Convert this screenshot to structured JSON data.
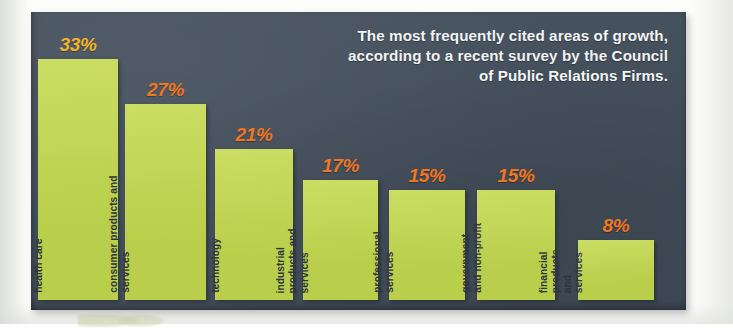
{
  "chart_title": "The most frequently cited areas of growth, according to a recent survey by the Council of Public Relations Firms.",
  "colors": {
    "panel_background": "#44505d",
    "bar_fill": "#c3d94e",
    "value_orange": "#ef7722",
    "value_gold": "#f0b429",
    "label_text": "#2d3540",
    "title_text": "#f2f4f4",
    "page_background": "#fdfdfb"
  },
  "chart_data": {
    "type": "bar",
    "title": "The most frequently cited areas of growth, according to a recent survey by the Council of Public Relations Firms.",
    "xlabel": "",
    "ylabel": "",
    "ylim": [
      0,
      35
    ],
    "grid": false,
    "legend": "none",
    "categories": [
      "health care",
      "consumer products and services",
      "technology",
      "industrial products and services",
      "professional services",
      "government and non-profit",
      "financial products and services"
    ],
    "values": [
      33,
      27,
      21,
      17,
      15,
      15,
      8
    ],
    "value_labels": [
      "33%",
      "27%",
      "21%",
      "17%",
      "15%",
      "15%",
      "8%"
    ]
  },
  "bars": [
    {
      "category": "health care",
      "value": 33,
      "value_label": "33%",
      "label_lines": "health care",
      "value_color": "gold"
    },
    {
      "category": "consumer products and services",
      "value": 27,
      "value_label": "27%",
      "label_lines": "consumer products and\nservices",
      "value_color": "orange"
    },
    {
      "category": "technology",
      "value": 21,
      "value_label": "21%",
      "label_lines": "technology",
      "value_color": "orange"
    },
    {
      "category": "industrial products and services",
      "value": 17,
      "value_label": "17%",
      "label_lines": "industrial\nproducts and\nservices",
      "value_color": "orange"
    },
    {
      "category": "professional services",
      "value": 15,
      "value_label": "15%",
      "label_lines": "professional\nservices",
      "value_color": "orange"
    },
    {
      "category": "government and non-profit",
      "value": 15,
      "value_label": "15%",
      "label_lines": "government\nand non-profit",
      "value_color": "orange"
    },
    {
      "category": "financial products and services",
      "value": 8,
      "value_label": "8%",
      "label_lines": "financial\nproducts\nand\nservices",
      "value_color": "orange"
    }
  ]
}
